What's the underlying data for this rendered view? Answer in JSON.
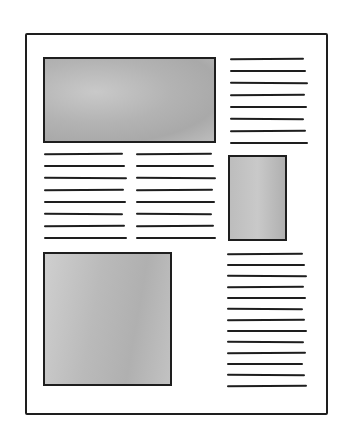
{
  "diagram": {
    "title": "",
    "colors": {
      "ink": "#1e1e1e",
      "image_fill": "#b3b3b3",
      "paper": "#ffffff"
    },
    "page": {
      "x": 25,
      "y": 33,
      "width": 303,
      "height": 382
    },
    "blocks": [
      {
        "type": "image-placeholder",
        "name": "top-image",
        "x": 43,
        "y": 57,
        "width": 173,
        "height": 86
      },
      {
        "type": "text-lines",
        "name": "top-right-text",
        "x": 230,
        "y": 58,
        "width": 76,
        "count": 8,
        "spacing": 12
      },
      {
        "type": "text-lines",
        "name": "middle-left-text-col1",
        "x": 44,
        "y": 153,
        "width": 81,
        "count": 8,
        "spacing": 12
      },
      {
        "type": "text-lines",
        "name": "middle-left-text-col2",
        "x": 136,
        "y": 153,
        "width": 78,
        "count": 8,
        "spacing": 12
      },
      {
        "type": "image-placeholder",
        "name": "small-right-image",
        "x": 228,
        "y": 155,
        "width": 59,
        "height": 86
      },
      {
        "type": "image-placeholder",
        "name": "bottom-left-image",
        "x": 43,
        "y": 252,
        "width": 129,
        "height": 134
      },
      {
        "type": "text-lines",
        "name": "bottom-right-text",
        "x": 227,
        "y": 253,
        "width": 78,
        "count": 13,
        "spacing": 11
      }
    ]
  }
}
